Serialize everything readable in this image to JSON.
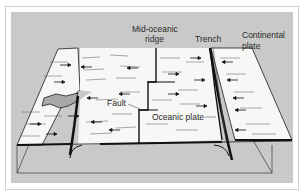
{
  "diagram": {
    "labels": {
      "mid_ridge_line1": "Mid-oceanic",
      "mid_ridge_line2": "ridge",
      "trench": "Trench",
      "continental_line1": "Continental",
      "continental_line2": "plate",
      "fault": "Fault",
      "oceanic_plate": "Oceanic plate"
    },
    "colors": {
      "background": "#ffffff",
      "panel": "#c9c9c9",
      "surface": "#f7f7f5",
      "ink": "#1a1a1a",
      "hole": "#a9a9a9"
    }
  }
}
